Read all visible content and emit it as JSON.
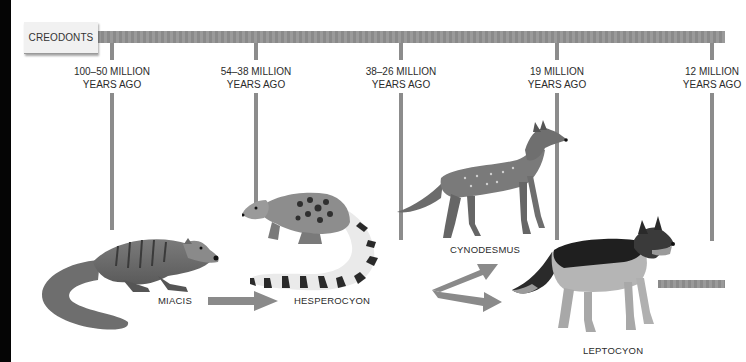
{
  "timeline": {
    "start_label": "CREODONTS",
    "periods": [
      {
        "line1": "100–50 MILLION",
        "line2": "YEARS AGO"
      },
      {
        "line1": "54–38 MILLION",
        "line2": "YEARS AGO"
      },
      {
        "line1": "38–26 MILLION",
        "line2": "YEARS AGO"
      },
      {
        "line1": "19 MILLION",
        "line2": "YEARS AGO"
      },
      {
        "line1": "12 MILLION",
        "line2": "YEARS AGO"
      }
    ]
  },
  "animals": [
    {
      "name": "MIACIS",
      "icon": "miacis-illustration"
    },
    {
      "name": "HESPEROCYON",
      "icon": "hesperocyon-illustration"
    },
    {
      "name": "CYNODESMUS",
      "icon": "cynodesmus-illustration"
    },
    {
      "name": "LEPTOCYON",
      "icon": "leptocyon-illustration"
    }
  ],
  "colors": {
    "bar": "#8f8f8f",
    "label_box": "#f1f1f1",
    "text": "#2b2b2b"
  }
}
